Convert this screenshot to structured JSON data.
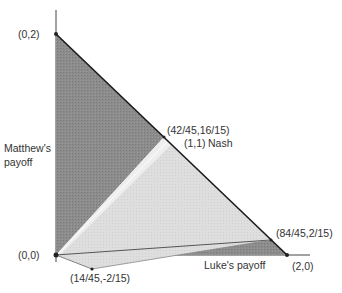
{
  "diagram": {
    "title": "",
    "axes": {
      "x_label": "Luke's payoff",
      "y_label_line1": "Matthew's",
      "y_label_line2": "payoff"
    },
    "points": {
      "origin": "(0,0)",
      "top": "(0,2)",
      "right": "(2,0)",
      "upper_kink": "(42/45,16/15)",
      "nash": "(1,1)",
      "nash_label": "Nash",
      "lower_right": "(84/45,2/15)",
      "lower_left": "(14/45,-2/15)"
    },
    "colors": {
      "dark_region": "#8a8a8a",
      "light_region": "#dcdcdc",
      "band": "#eeeeee",
      "lines": "#222222",
      "text": "#333333"
    }
  }
}
